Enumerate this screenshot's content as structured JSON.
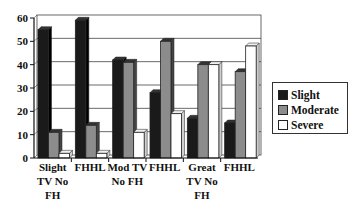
{
  "chart_data": {
    "type": "bar",
    "style": "3d-clustered-column",
    "title": "",
    "xlabel": "",
    "ylabel": "",
    "ylim": [
      0,
      60
    ],
    "yticks": [
      0,
      10,
      20,
      30,
      40,
      50,
      60
    ],
    "grid": true,
    "legend_position": "right",
    "categories": [
      [
        "Slight",
        "TV No",
        "FH"
      ],
      [
        "FHHL"
      ],
      [
        "Mod TV",
        "No FH"
      ],
      [
        "FHHL"
      ],
      [
        "Great",
        "TV No",
        "FH"
      ],
      [
        "FHHL"
      ]
    ],
    "series": [
      {
        "name": "Slight",
        "color": "#1a1a1a",
        "values": [
          55,
          59,
          42,
          28,
          17,
          15
        ]
      },
      {
        "name": "Moderate",
        "color": "#8c8c8c",
        "values": [
          11,
          14,
          41,
          50,
          40,
          37
        ]
      },
      {
        "name": "Severe",
        "color": "#ffffff",
        "values": [
          2,
          2,
          11,
          19,
          40,
          48
        ]
      }
    ]
  },
  "legend": {
    "items": [
      {
        "label": "Slight",
        "color": "#1a1a1a"
      },
      {
        "label": "Moderate",
        "color": "#8c8c8c"
      },
      {
        "label": "Severe",
        "color": "#ffffff"
      }
    ]
  }
}
